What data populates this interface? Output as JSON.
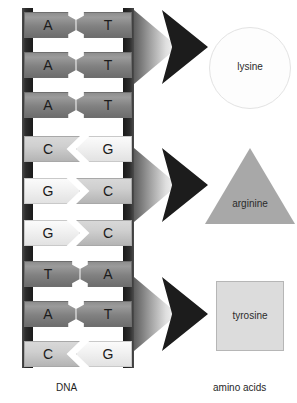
{
  "diagram": {
    "type": "dna-to-amino-acids",
    "captions": {
      "left": "DNA",
      "right": "amino acids"
    },
    "dna": {
      "label": "DNA",
      "backbone_color": "#2c2c2c",
      "base_pairs": [
        {
          "left": "A",
          "right": "T",
          "left_style": "dark",
          "right_style": "dark",
          "joint": "round"
        },
        {
          "left": "A",
          "right": "T",
          "left_style": "dark",
          "right_style": "dark",
          "joint": "round"
        },
        {
          "left": "A",
          "right": "T",
          "left_style": "dark",
          "right_style": "dark",
          "joint": "round"
        },
        {
          "left": "C",
          "right": "G",
          "left_style": "mid",
          "right_style": "light",
          "joint": "chevron-left"
        },
        {
          "left": "G",
          "right": "C",
          "left_style": "light",
          "right_style": "mid",
          "joint": "chevron-right"
        },
        {
          "left": "G",
          "right": "C",
          "left_style": "light",
          "right_style": "mid",
          "joint": "chevron-right"
        },
        {
          "left": "T",
          "right": "A",
          "left_style": "dark",
          "right_style": "dark",
          "joint": "round-reverse"
        },
        {
          "left": "A",
          "right": "T",
          "left_style": "dark",
          "right_style": "dark",
          "joint": "round"
        },
        {
          "left": "C",
          "right": "G",
          "left_style": "mid",
          "right_style": "light",
          "joint": "chevron-left"
        }
      ]
    },
    "arrows": [
      {
        "name": "arrow-1",
        "head_color": "#1c1c1c"
      },
      {
        "name": "arrow-2",
        "head_color": "#1c1c1c"
      },
      {
        "name": "arrow-3",
        "head_color": "#1c1c1c"
      }
    ],
    "amino_acids": [
      {
        "name": "lysine",
        "shape": "circle",
        "fill": "#fdfdfd",
        "stroke": "#e3e3e3"
      },
      {
        "name": "arginine",
        "shape": "triangle",
        "fill": "#a8a8a8",
        "stroke": "#9a9a9a"
      },
      {
        "name": "tyrosine",
        "shape": "square",
        "fill": "#dcdcdc",
        "stroke": "#b6b6b6"
      }
    ]
  }
}
